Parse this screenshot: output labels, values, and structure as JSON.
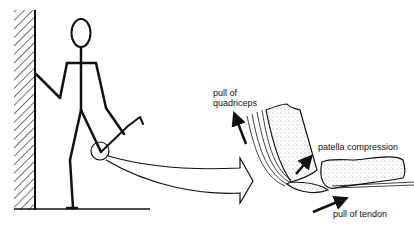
{
  "figure": {
    "labels": {
      "quadriceps": "pull of\nquadriceps",
      "quadriceps_line1": "pull of",
      "quadriceps_line2": "quadriceps",
      "patella": "patella compression",
      "tendon": "pull of tendon"
    },
    "colors": {
      "ink": "#111111",
      "background": "#ffffff"
    }
  }
}
